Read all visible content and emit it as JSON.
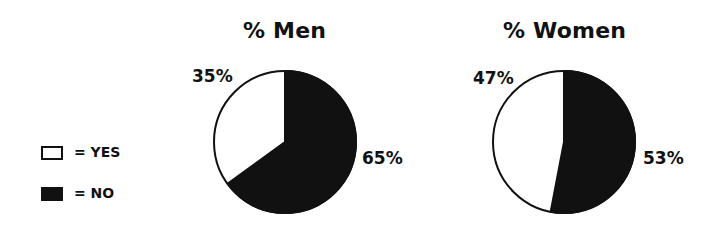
{
  "legend": {
    "items": [
      {
        "label": "= YES",
        "color": "#ffffff"
      },
      {
        "label": "= NO",
        "color": "#111111"
      }
    ]
  },
  "charts": [
    {
      "title": "% Men",
      "yes_label": "35%",
      "no_label": "65%"
    },
    {
      "title": "% Women",
      "yes_label": "47%",
      "no_label": "53%"
    }
  ],
  "chart_data": [
    {
      "type": "pie",
      "title": "% Men",
      "categories": [
        "YES",
        "NO"
      ],
      "values": [
        35,
        65
      ],
      "colors": [
        "#ffffff",
        "#111111"
      ],
      "legend_position": "left"
    },
    {
      "type": "pie",
      "title": "% Women",
      "categories": [
        "YES",
        "NO"
      ],
      "values": [
        47,
        53
      ],
      "colors": [
        "#ffffff",
        "#111111"
      ],
      "legend_position": "left"
    }
  ]
}
